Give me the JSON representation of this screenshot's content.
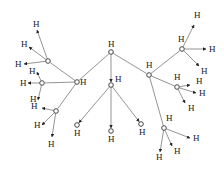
{
  "diagram": {
    "title": "",
    "node_label": "H",
    "colors": {
      "edge": "#666666",
      "node_stroke": "#333333",
      "text": "#222222",
      "background": "#ffffff"
    },
    "nodes": [
      {
        "id": "root",
        "x": 111,
        "y": 52,
        "label": "H",
        "lx": 108,
        "ly": 47
      },
      {
        "id": "left_hub",
        "x": 77,
        "y": 82,
        "label": "H",
        "lx": 80,
        "ly": 85
      },
      {
        "id": "center_hub",
        "x": 111,
        "y": 85,
        "label": "H",
        "lx": 115,
        "ly": 82
      },
      {
        "id": "right_hub",
        "x": 149,
        "y": 75,
        "label": "H",
        "lx": 146,
        "ly": 68
      },
      {
        "id": "ul",
        "x": 48,
        "y": 61,
        "label": "",
        "lx": 0,
        "ly": 0
      },
      {
        "id": "ml",
        "x": 42,
        "y": 83,
        "label": "",
        "lx": 0,
        "ly": 0
      },
      {
        "id": "ll",
        "x": 56,
        "y": 111,
        "label": "",
        "lx": 0,
        "ly": 0
      },
      {
        "id": "c1",
        "x": 77,
        "y": 125,
        "label": "H",
        "lx": 74,
        "ly": 136
      },
      {
        "id": "c2",
        "x": 111,
        "y": 131,
        "label": "H",
        "lx": 108,
        "ly": 142
      },
      {
        "id": "c3",
        "x": 141,
        "y": 124,
        "label": "H",
        "lx": 139,
        "ly": 135
      },
      {
        "id": "ur",
        "x": 182,
        "y": 49,
        "label": "H",
        "lx": 178,
        "ly": 42
      },
      {
        "id": "mr",
        "x": 177,
        "y": 87,
        "label": "H",
        "lx": 174,
        "ly": 80
      },
      {
        "id": "lr",
        "x": 164,
        "y": 128,
        "label": "H",
        "lx": 166,
        "ly": 121
      }
    ],
    "edges": [
      {
        "from": "root",
        "to": "left_hub"
      },
      {
        "from": "root",
        "to": "center_hub",
        "arrow": true
      },
      {
        "from": "root",
        "to": "right_hub"
      },
      {
        "from": "left_hub",
        "to": "ul"
      },
      {
        "from": "left_hub",
        "to": "ml"
      },
      {
        "from": "left_hub",
        "to": "ll"
      },
      {
        "from": "center_hub",
        "to": "c1",
        "arrow": true
      },
      {
        "from": "center_hub",
        "to": "c2",
        "arrow": true
      },
      {
        "from": "center_hub",
        "to": "c3",
        "arrow": true
      },
      {
        "from": "right_hub",
        "to": "ur"
      },
      {
        "from": "right_hub",
        "to": "mr"
      },
      {
        "from": "right_hub",
        "to": "lr"
      }
    ],
    "leaves": [
      {
        "from": "ul",
        "x": 37,
        "y": 30,
        "lx": 33,
        "ly": 27
      },
      {
        "from": "ul",
        "x": 29,
        "y": 47,
        "lx": 21,
        "ly": 47
      },
      {
        "from": "ul",
        "x": 24,
        "y": 64,
        "lx": 15,
        "ly": 67
      },
      {
        "from": "ml",
        "x": 37,
        "y": 72,
        "lx": 29,
        "ly": 74
      },
      {
        "from": "ml",
        "x": 28,
        "y": 83,
        "lx": 20,
        "ly": 86
      },
      {
        "from": "ml",
        "x": 38,
        "y": 100,
        "lx": 30,
        "ly": 102
      },
      {
        "from": "ll",
        "x": 42,
        "y": 108,
        "lx": 31,
        "ly": 109
      },
      {
        "from": "ll",
        "x": 42,
        "y": 125,
        "lx": 34,
        "ly": 128
      },
      {
        "from": "ll",
        "x": 52,
        "y": 137,
        "lx": 48,
        "ly": 147
      },
      {
        "from": "ur",
        "x": 194,
        "y": 25,
        "lx": 194,
        "ly": 18
      },
      {
        "from": "ur",
        "x": 206,
        "y": 49,
        "lx": 209,
        "ly": 52
      },
      {
        "from": "ur",
        "x": 199,
        "y": 66,
        "lx": 201,
        "ly": 74
      },
      {
        "from": "mr",
        "x": 196,
        "y": 93,
        "lx": 199,
        "ly": 96
      },
      {
        "from": "mr",
        "x": 185,
        "y": 103,
        "lx": 188,
        "ly": 111
      },
      {
        "from": "mr",
        "x": 190,
        "y": 85,
        "lx": 196,
        "ly": 84
      },
      {
        "from": "lr",
        "x": 190,
        "y": 138,
        "lx": 193,
        "ly": 141
      },
      {
        "from": "lr",
        "x": 172,
        "y": 146,
        "lx": 174,
        "ly": 154
      },
      {
        "from": "lr",
        "x": 160,
        "y": 152,
        "lx": 156,
        "ly": 160
      }
    ]
  }
}
